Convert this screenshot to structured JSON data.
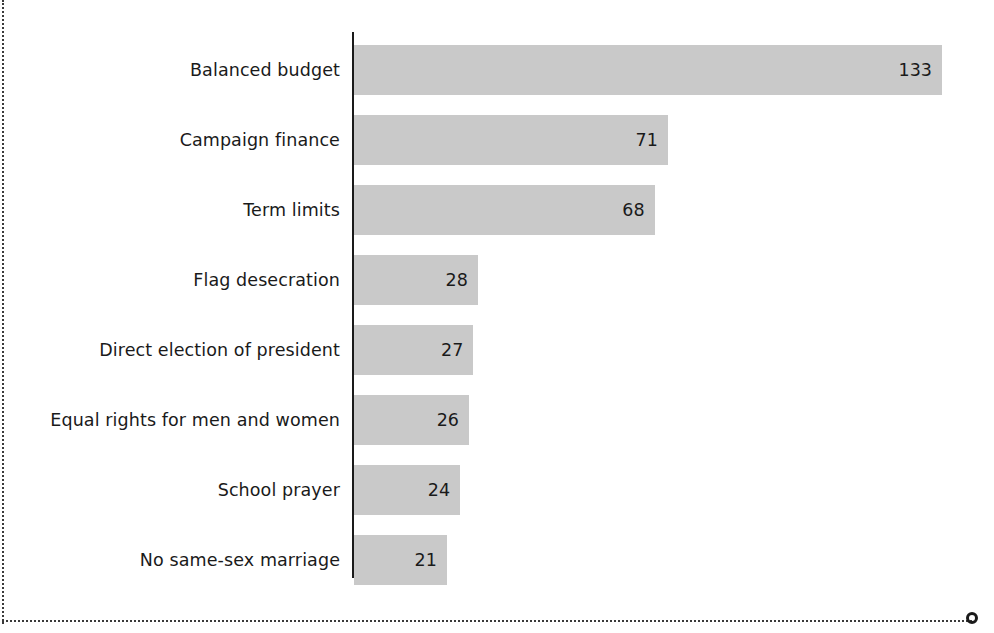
{
  "chart_data": {
    "type": "bar",
    "orientation": "horizontal",
    "title": "",
    "subtitle": "",
    "xlabel": "",
    "ylabel": "",
    "categories": [
      "Balanced budget",
      "Campaign finance",
      "Term limits",
      "Flag desecration",
      "Direct election of president",
      "Equal rights for men and women",
      "School prayer",
      "No same-sex marriage"
    ],
    "values": [
      133,
      71,
      68,
      28,
      27,
      26,
      24,
      21
    ],
    "value_labels": [
      "133",
      "71",
      "68",
      "28",
      "27",
      "26",
      "24",
      "21"
    ],
    "xlim": [
      0,
      133
    ],
    "grid": false,
    "legend": false,
    "bar_color": "#c9c9c9",
    "text_color": "#1a1a1a",
    "axis_color": "#1a1a1a",
    "background": "#ffffff",
    "group_break_after_index": 2
  },
  "page": {
    "border_style": "dotted",
    "border_color": "#3a3a3a",
    "corner_marker": "circle-marker"
  }
}
